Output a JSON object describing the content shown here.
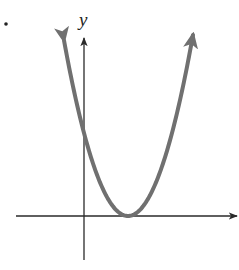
{
  "figure": {
    "type": "graph-of-parabola",
    "axes": {
      "y_label": "y",
      "x_label": ""
    },
    "colors": {
      "axis": "#2a2a2a",
      "curve": "#707070",
      "background": "#ffffff"
    },
    "marker": "•"
  },
  "chart_data": {
    "type": "line",
    "title": "",
    "xlabel": "",
    "ylabel": "y",
    "series": [
      {
        "name": "parabola",
        "shape": "upward parabola",
        "vertex_px": [
          128,
          216
        ],
        "y_intercept_px": [
          84,
          133
        ],
        "left_arrow_tip_px": [
          64,
          38
        ],
        "right_arrow_tip_px": [
          193,
          38
        ]
      }
    ],
    "axes_origin_px": [
      84,
      216
    ],
    "grid": false,
    "ticks": false
  }
}
